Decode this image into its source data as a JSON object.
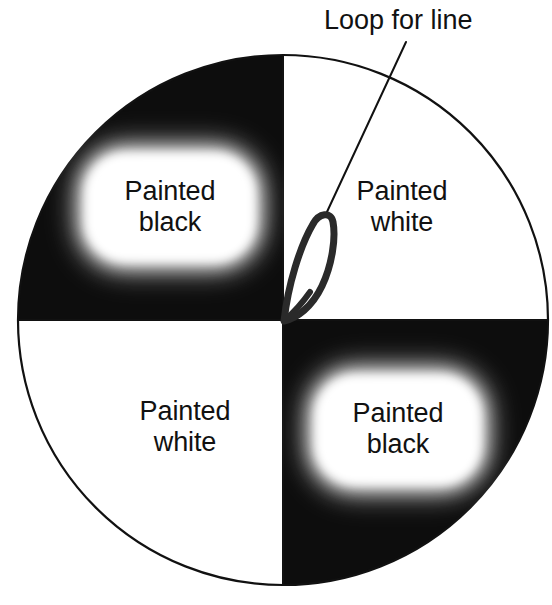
{
  "figure": {
    "background_color": "#ffffff",
    "stroke_color": "#111111",
    "black_fill": "#0d0d0d",
    "white_fill": "#ffffff",
    "circle": {
      "center_x": 283,
      "center_y": 320,
      "radius": 265,
      "stroke_width": 2.2
    },
    "quadrants": [
      {
        "id": "top-left",
        "fill": "black",
        "label": "Painted\nblack",
        "label_plate": true
      },
      {
        "id": "top-right",
        "fill": "white",
        "label": "Painted\nwhite",
        "label_plate": false
      },
      {
        "id": "bottom-left",
        "fill": "white",
        "label": "Painted\nwhite",
        "label_plate": false
      },
      {
        "id": "bottom-right",
        "fill": "black",
        "label": "Painted\nblack",
        "label_plate": true
      }
    ],
    "labels": {
      "top_left": "Painted\nblack",
      "top_right": "Painted\nwhite",
      "bottom_left": "Painted\nwhite",
      "bottom_right": "Painted\nblack",
      "loop_callout": "Loop for line"
    },
    "loop": {
      "description": "narrow teardrop loop anchored at disc center, rising up-right",
      "anchor_x": 283,
      "anchor_y": 320,
      "apex_x": 324,
      "apex_y": 216,
      "stroke_width": 7
    },
    "leader_line": {
      "from_x": 406,
      "from_y": 42,
      "to_x": 326,
      "to_y": 214,
      "stroke_width": 2
    }
  }
}
